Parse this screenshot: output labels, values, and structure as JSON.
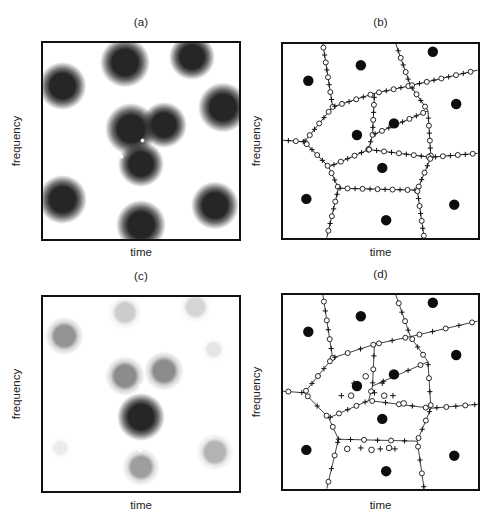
{
  "figure": {
    "width": 503,
    "height": 532,
    "background": "#ffffff",
    "ink": "#111111"
  },
  "panels": [
    {
      "id": "a",
      "title": "(a)",
      "xlabel": "time",
      "ylabel": "frequency",
      "type": "density-map"
    },
    {
      "id": "b",
      "title": "(b)",
      "xlabel": "time",
      "ylabel": "frequency",
      "type": "voronoi"
    },
    {
      "id": "c",
      "title": "(c)",
      "xlabel": "time",
      "ylabel": "frequency",
      "type": "density-map"
    },
    {
      "id": "d",
      "title": "(d)",
      "xlabel": "time",
      "ylabel": "frequency",
      "type": "voronoi"
    }
  ],
  "chart_data": {
    "type": "scatter",
    "title": "",
    "xlabel": "time",
    "ylabel": "frequency",
    "xlim": [
      0,
      1
    ],
    "ylim": [
      0,
      1
    ],
    "grid": false,
    "legend": "none",
    "panel_a": {
      "label": "(a)",
      "description": "grayscale time-frequency density map, uniform dark blobs",
      "blobs": [
        {
          "x": 0.1,
          "y": 0.22,
          "r": 0.115,
          "level": 1.0
        },
        {
          "x": 0.42,
          "y": 0.1,
          "r": 0.12,
          "level": 1.0
        },
        {
          "x": 0.76,
          "y": 0.07,
          "r": 0.11,
          "level": 1.0
        },
        {
          "x": 0.92,
          "y": 0.33,
          "r": 0.12,
          "level": 1.0
        },
        {
          "x": 0.45,
          "y": 0.44,
          "r": 0.125,
          "level": 1.0
        },
        {
          "x": 0.62,
          "y": 0.42,
          "r": 0.11,
          "level": 1.0
        },
        {
          "x": 0.5,
          "y": 0.62,
          "r": 0.11,
          "level": 1.0
        },
        {
          "x": 0.1,
          "y": 0.8,
          "r": 0.115,
          "level": 1.0
        },
        {
          "x": 0.5,
          "y": 0.93,
          "r": 0.12,
          "level": 1.0
        },
        {
          "x": 0.88,
          "y": 0.83,
          "r": 0.115,
          "level": 1.0
        }
      ],
      "sparks": [
        {
          "x": 0.26,
          "y": 0.17
        },
        {
          "x": 0.6,
          "y": 0.16
        },
        {
          "x": 0.845,
          "y": 0.165
        },
        {
          "x": 0.56,
          "y": 0.26
        },
        {
          "x": 0.7,
          "y": 0.25
        },
        {
          "x": 0.44,
          "y": 0.3
        },
        {
          "x": 0.51,
          "y": 0.5
        },
        {
          "x": 0.4,
          "y": 0.58
        },
        {
          "x": 0.6,
          "y": 0.55
        },
        {
          "x": 0.41,
          "y": 0.76
        },
        {
          "x": 0.6,
          "y": 0.76
        },
        {
          "x": 0.74,
          "y": 0.92
        },
        {
          "x": 0.245,
          "y": 0.845
        }
      ]
    },
    "panel_c": {
      "label": "(c)",
      "description": "grayscale time-frequency density map, intensity decays away from centre",
      "blobs": [
        {
          "x": 0.5,
          "y": 0.62,
          "r": 0.115,
          "level": 1.0
        },
        {
          "x": 0.42,
          "y": 0.41,
          "r": 0.095,
          "level": 0.45
        },
        {
          "x": 0.62,
          "y": 0.38,
          "r": 0.095,
          "level": 0.45
        },
        {
          "x": 0.5,
          "y": 0.88,
          "r": 0.09,
          "level": 0.38
        },
        {
          "x": 0.11,
          "y": 0.2,
          "r": 0.095,
          "level": 0.42
        },
        {
          "x": 0.42,
          "y": 0.08,
          "r": 0.085,
          "level": 0.2
        },
        {
          "x": 0.78,
          "y": 0.05,
          "r": 0.08,
          "level": 0.16
        },
        {
          "x": 0.88,
          "y": 0.8,
          "r": 0.09,
          "level": 0.3
        },
        {
          "x": 0.87,
          "y": 0.27,
          "r": 0.06,
          "level": 0.1
        },
        {
          "x": 0.09,
          "y": 0.78,
          "r": 0.055,
          "level": 0.08
        }
      ],
      "sparks": [
        {
          "x": 0.5,
          "y": 0.455
        },
        {
          "x": 0.395,
          "y": 0.515
        },
        {
          "x": 0.605,
          "y": 0.505
        },
        {
          "x": 0.5,
          "y": 0.795
        }
      ]
    },
    "panel_b": {
      "label": "(b)",
      "description": "Voronoi tessellation of the time-frequency plane; filled dots are cell centres, open circles and plus signs are markers sampled along the cell edges",
      "centers": [
        {
          "x": 0.13,
          "y": 0.19
        },
        {
          "x": 0.4,
          "y": 0.11
        },
        {
          "x": 0.77,
          "y": 0.04
        },
        {
          "x": 0.89,
          "y": 0.31
        },
        {
          "x": 0.57,
          "y": 0.41
        },
        {
          "x": 0.38,
          "y": 0.47
        },
        {
          "x": 0.51,
          "y": 0.64
        },
        {
          "x": 0.12,
          "y": 0.8
        },
        {
          "x": 0.53,
          "y": 0.91
        },
        {
          "x": 0.88,
          "y": 0.83
        }
      ],
      "vertices": [
        {
          "x": 0.255,
          "y": 0.325
        },
        {
          "x": 0.46,
          "y": 0.255
        },
        {
          "x": 0.655,
          "y": 0.215
        },
        {
          "x": 0.745,
          "y": 0.345
        },
        {
          "x": 0.47,
          "y": 0.305
        },
        {
          "x": 0.11,
          "y": 0.505
        },
        {
          "x": 0.235,
          "y": 0.635
        },
        {
          "x": 0.44,
          "y": 0.545
        },
        {
          "x": 0.76,
          "y": 0.585
        },
        {
          "x": 0.285,
          "y": 0.745
        },
        {
          "x": 0.69,
          "y": 0.755
        }
      ],
      "marker_types": [
        "circle",
        "plus"
      ]
    },
    "panel_d": {
      "label": "(d)",
      "description": "same Voronoi tessellation as (b) with sparser, irregular marker placement",
      "centers": [
        {
          "x": 0.13,
          "y": 0.19
        },
        {
          "x": 0.4,
          "y": 0.11
        },
        {
          "x": 0.77,
          "y": 0.04
        },
        {
          "x": 0.89,
          "y": 0.31
        },
        {
          "x": 0.57,
          "y": 0.41
        },
        {
          "x": 0.38,
          "y": 0.47
        },
        {
          "x": 0.51,
          "y": 0.64
        },
        {
          "x": 0.12,
          "y": 0.8
        },
        {
          "x": 0.53,
          "y": 0.91
        },
        {
          "x": 0.88,
          "y": 0.83
        }
      ],
      "marker_types": [
        "circle",
        "plus"
      ]
    }
  }
}
